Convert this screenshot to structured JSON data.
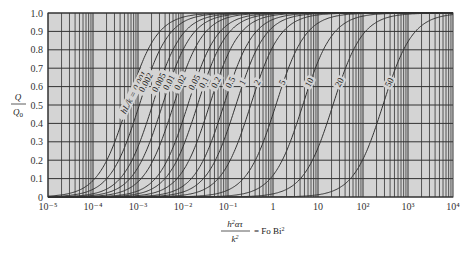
{
  "chart_data": {
    "type": "line",
    "title": "",
    "xlabel": "h²ατ / k² = Fo Bi²",
    "ylabel": "Q / Q₀",
    "xscale": "log",
    "xlim": [
      1e-05,
      10000
    ],
    "ylim": [
      0,
      1.0
    ],
    "grid": true,
    "background": "#d4d4d4",
    "x_ticks": [
      "10⁻⁵",
      "10⁻⁴",
      "10⁻³",
      "10⁻²",
      "10⁻¹",
      "1",
      "10",
      "10²",
      "10³",
      "10⁴"
    ],
    "y_ticks": [
      "0",
      "0.1",
      "0.2",
      "0.3",
      "0.4",
      "0.5",
      "0.6",
      "0.7",
      "0.8",
      "0.9",
      "1.0"
    ],
    "series_param_label": "hL/k",
    "series": [
      {
        "name": "hL/k = 0.001",
        "label": "hL/k = 0.001",
        "x_at_half": 0.00058
      },
      {
        "name": "0.002",
        "label": "0.002",
        "x_at_half": 0.00107
      },
      {
        "name": "0.005",
        "label": "0.005",
        "x_at_half": 0.0021
      },
      {
        "name": "0.01",
        "label": "0.01",
        "x_at_half": 0.0035
      },
      {
        "name": "0.02",
        "label": "0.02",
        "x_at_half": 0.0062
      },
      {
        "name": "0.05",
        "label": "0.05",
        "x_at_half": 0.0128
      },
      {
        "name": "0.1",
        "label": "0.1",
        "x_at_half": 0.021
      },
      {
        "name": "0.2",
        "label": "0.2",
        "x_at_half": 0.039
      },
      {
        "name": "0.5",
        "label": "0.5",
        "x_at_half": 0.081
      },
      {
        "name": "1",
        "label": "1",
        "x_at_half": 0.15
      },
      {
        "name": "2",
        "label": "2",
        "x_at_half": 0.32
      },
      {
        "name": "5",
        "label": "5",
        "x_at_half": 1.16
      },
      {
        "name": "10",
        "label": "10",
        "x_at_half": 4.6
      },
      {
        "name": "20",
        "label": "20",
        "x_at_half": 21.5
      },
      {
        "name": "50",
        "label": "50",
        "x_at_half": 278
      }
    ]
  }
}
